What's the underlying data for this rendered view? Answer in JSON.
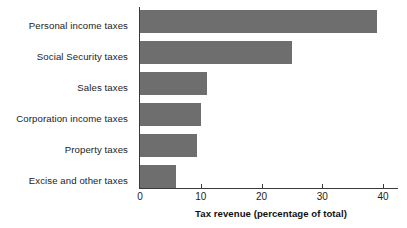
{
  "chart_data": {
    "type": "bar",
    "orientation": "horizontal",
    "title": "",
    "subtitle": "",
    "xlabel": "Tax revenue (percentage of total)",
    "ylabel": "",
    "categories": [
      "Personal income taxes",
      "Social Security taxes",
      "Sales taxes",
      "Corporation income taxes",
      "Property taxes",
      "Excise and other taxes"
    ],
    "values": [
      39,
      25,
      11,
      10,
      9.4,
      6
    ],
    "series": [
      {
        "name": "Tax revenue (percentage of total)",
        "values": [
          39,
          25,
          11,
          10,
          9.4,
          6
        ]
      }
    ],
    "xlim": [
      0,
      42.5
    ],
    "xticks": [
      0,
      10,
      20,
      30,
      40
    ],
    "xtick_labels": [
      "0",
      "10",
      "20",
      "30",
      "40"
    ],
    "grid": false,
    "legend": false,
    "legend_position": "none",
    "bar_color": "#6e6e6e",
    "axis_color": "#3a3a3a",
    "text_color": "#1c1c1c"
  },
  "axis": {
    "x_title": "Tax revenue (percentage of total)",
    "ticks": [
      {
        "value": 0,
        "label": "0"
      },
      {
        "value": 10,
        "label": "10"
      },
      {
        "value": 20,
        "label": "20"
      },
      {
        "value": 30,
        "label": "30"
      },
      {
        "value": 40,
        "label": "40"
      }
    ]
  }
}
